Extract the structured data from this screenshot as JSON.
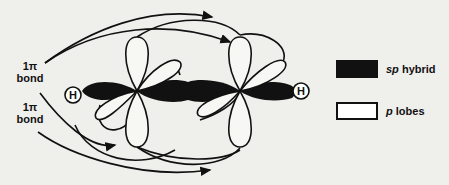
{
  "diagram": {
    "atoms": [
      {
        "symbol": "H",
        "position": "left"
      },
      {
        "symbol": "H",
        "position": "right"
      }
    ],
    "labels": [
      {
        "id": "pi_bond_upper",
        "line1": "1π",
        "line2": "bond"
      },
      {
        "id": "pi_bond_lower",
        "line1": "1π",
        "line2": "bond"
      }
    ],
    "legend": [
      {
        "symbol": "sp",
        "text": "hybrid",
        "fill": "#111111"
      },
      {
        "symbol": "p",
        "text": "lobes",
        "fill": "#ffffff"
      }
    ]
  },
  "colors": {
    "background": "#efefec",
    "ink": "#111111"
  }
}
